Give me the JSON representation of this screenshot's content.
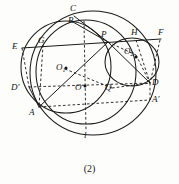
{
  "figure": {
    "caption": "(2)",
    "line_label": "l",
    "stroke_color": "#1a1a1a",
    "background_color": "#fdfdfb",
    "points": [
      {
        "id": "C",
        "label": "C",
        "base": "C",
        "sub": "",
        "prime": false,
        "x": 74,
        "y": 16,
        "lx": 70,
        "ly": 4
      },
      {
        "id": "B",
        "label": "B",
        "base": "B",
        "sub": "",
        "prime": false,
        "x": 73,
        "y": 22,
        "lx": 68,
        "ly": 16
      },
      {
        "id": "P",
        "label": "P",
        "base": "P",
        "sub": "",
        "prime": false,
        "x": 108,
        "y": 42,
        "lx": 101,
        "ly": 30
      },
      {
        "id": "H",
        "label": "H",
        "base": "H",
        "sub": "",
        "prime": false,
        "x": 136,
        "y": 40,
        "lx": 131,
        "ly": 28
      },
      {
        "id": "F",
        "label": "F",
        "base": "F",
        "sub": "",
        "prime": false,
        "x": 160,
        "y": 40,
        "lx": 158,
        "ly": 28
      },
      {
        "id": "E",
        "label": "E",
        "base": "E",
        "sub": "",
        "prime": false,
        "x": 22,
        "y": 48,
        "lx": 12,
        "ly": 42
      },
      {
        "id": "G",
        "label": "G",
        "base": "G",
        "sub": "",
        "prime": false,
        "x": 43,
        "y": 45,
        "lx": 38,
        "ly": 36
      },
      {
        "id": "O2",
        "label": "O₂",
        "base": "O",
        "sub": "2",
        "prime": false,
        "x": 136,
        "y": 55,
        "lx": 124,
        "ly": 47
      },
      {
        "id": "O1",
        "label": "O₁",
        "base": "O",
        "sub": "1",
        "prime": false,
        "x": 65,
        "y": 69,
        "lx": 56,
        "ly": 63
      },
      {
        "id": "D",
        "label": "D",
        "base": "D",
        "sub": "",
        "prime": false,
        "x": 150,
        "y": 83,
        "lx": 152,
        "ly": 78
      },
      {
        "id": "Dp",
        "label": "D'",
        "base": "D",
        "sub": "",
        "prime": true,
        "x": 29,
        "y": 87,
        "lx": 11,
        "ly": 83
      },
      {
        "id": "O",
        "label": "O",
        "base": "O",
        "sub": "",
        "prime": false,
        "x": 85,
        "y": 87,
        "lx": 75,
        "ly": 83
      },
      {
        "id": "Q",
        "label": "Q",
        "base": "Q",
        "sub": "",
        "prime": false,
        "x": 112,
        "y": 88,
        "lx": 105,
        "ly": 83
      },
      {
        "id": "Ap",
        "label": "A'",
        "base": "A",
        "sub": "",
        "prime": true,
        "x": 150,
        "y": 100,
        "lx": 152,
        "ly": 95
      },
      {
        "id": "A",
        "label": "A",
        "base": "A",
        "sub": "",
        "prime": false,
        "x": 39,
        "y": 107,
        "lx": 29,
        "ly": 108
      }
    ],
    "circles": [
      {
        "id": "circle-O1",
        "cx": 66,
        "cy": 67,
        "r": 45
      },
      {
        "id": "circle-O2",
        "cx": 130,
        "cy": 62,
        "r": 25
      },
      {
        "id": "circle-O",
        "cx": 86,
        "cy": 73,
        "r": 55
      },
      {
        "id": "circle-big",
        "cx": 94,
        "cy": 72,
        "r": 62
      }
    ]
  }
}
